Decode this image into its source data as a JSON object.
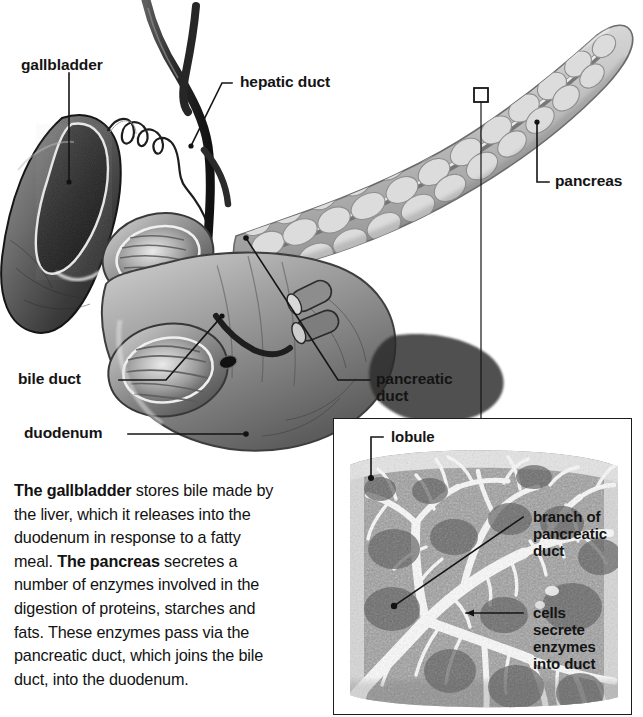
{
  "figure": {
    "background_color": "#ffffff",
    "ink_color": "#141414"
  },
  "labels": {
    "gallbladder": "gallbladder",
    "hepatic_duct": "hepatic duct",
    "pancreas": "pancreas",
    "bile_duct": "bile duct",
    "duodenum": "duodenum",
    "pancreatic_duct_line1": "pancreatic",
    "pancreatic_duct_line2": "duct"
  },
  "inset_labels": {
    "lobule": "lobule",
    "branch_line1": "branch of",
    "branch_line2": "pancreatic",
    "branch_line3": "duct",
    "cells_line1": "cells",
    "cells_line2": "secrete",
    "cells_line3": "enzymes",
    "cells_line4": "into duct"
  },
  "caption": {
    "segments": [
      {
        "text": "The gallbladder",
        "bold": true
      },
      {
        "text": " stores bile made by the liver, which it releases into the duodenum in response to a fatty meal. ",
        "bold": false
      },
      {
        "text": "The pancreas",
        "bold": true
      },
      {
        "text": " secretes a number of enzymes involved in the digestion of proteins, starches and fats. These enzymes pass via the pancreatic duct, which joins the bile duct, into the duodenum.",
        "bold": false
      }
    ],
    "plain_text": "The gallbladder stores bile made by the liver, which it releases into the duodenum in response to a fatty meal. The pancreas secretes a number of enzymes involved in the digestion of proteins, starches and fats. These enzymes pass via the pancreatic duct, which joins the bile duct, into the duodenum."
  },
  "markers": {
    "magnification_box": "square-marker-on-pancreas"
  }
}
